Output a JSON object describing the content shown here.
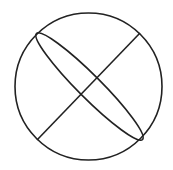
{
  "diagram": {
    "background": "#ffffff",
    "stroke_color": "#222222",
    "stroke_width": 1.6,
    "circle": {
      "cx": 88.5,
      "cy": 86.5,
      "r": 73.5
    },
    "ellipse": {
      "cx": 89.5,
      "cy": 86.5,
      "rx": 75,
      "ry": 11.5,
      "rotation": 45
    },
    "line": {
      "x1": 37,
      "y1": 140,
      "x2": 140,
      "y2": 33
    }
  }
}
